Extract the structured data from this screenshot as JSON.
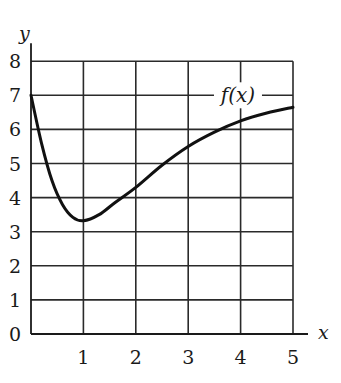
{
  "chart_data": {
    "type": "line",
    "title": "",
    "xlabel": "x",
    "ylabel": "y",
    "xlim": [
      0,
      5
    ],
    "ylim": [
      0,
      8
    ],
    "grid": true,
    "x_ticks": [
      "1",
      "2",
      "3",
      "4",
      "5"
    ],
    "y_ticks": [
      "0",
      "1",
      "2",
      "3",
      "4",
      "5",
      "6",
      "7",
      "8"
    ],
    "series": [
      {
        "name": "f(x)",
        "x": [
          0,
          0.2,
          0.4,
          0.6,
          0.8,
          1.0,
          1.3,
          1.6,
          2.0,
          2.5,
          3.0,
          3.5,
          4.0,
          4.5,
          5.0
        ],
        "values": [
          7.0,
          5.6,
          4.5,
          3.8,
          3.42,
          3.32,
          3.5,
          3.85,
          4.3,
          4.95,
          5.5,
          5.92,
          6.25,
          6.48,
          6.65
        ]
      }
    ],
    "annotations": [
      {
        "text": "f(x)",
        "x": 3.95,
        "y": 7
      }
    ],
    "legend": "none (inline label on curve)"
  },
  "labels": {
    "x_axis": "x",
    "y_axis": "y",
    "curve": "f(x)"
  },
  "colors": {
    "line": "#111111",
    "grid": "#2a2a2a",
    "background": "#ffffff"
  }
}
